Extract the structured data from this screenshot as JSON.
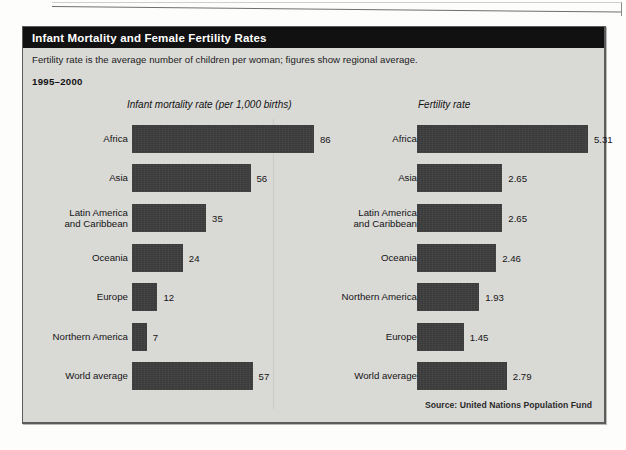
{
  "panel": {
    "title": "Infant Mortality and Female Fertility Rates",
    "subtitle": "Fertility rate is the average number of children per woman; figures show regional average.",
    "period": "1995–2000",
    "source": "Source: United Nations Population Fund"
  },
  "chart_data": [
    {
      "type": "bar",
      "orientation": "horizontal",
      "title": "Infant mortality rate (per 1,000 births)",
      "xlabel": "",
      "ylabel": "",
      "xlim": [
        0,
        86
      ],
      "grid": false,
      "legend": null,
      "categories": [
        "Africa",
        "Asia",
        "Latin America\nand Caribbean",
        "Oceania",
        "Europe",
        "Northern America",
        "World average"
      ],
      "values": [
        86,
        56,
        35,
        24,
        12,
        7,
        57
      ],
      "value_labels": [
        "86",
        "56",
        "35",
        "24",
        "12",
        "7",
        "57"
      ]
    },
    {
      "type": "bar",
      "orientation": "horizontal",
      "title": "Fertility rate",
      "xlabel": "",
      "ylabel": "",
      "xlim": [
        0,
        5.31
      ],
      "grid": false,
      "legend": null,
      "categories": [
        "Africa",
        "Asia",
        "Latin America\nand Caribbean",
        "Oceania",
        "Northern America",
        "Europe",
        "World average"
      ],
      "values": [
        5.31,
        2.65,
        2.65,
        2.46,
        1.93,
        1.45,
        2.79
      ],
      "value_labels": [
        "5.31",
        "2.65",
        "2.65",
        "2.46",
        "1.93",
        "1.45",
        "2.79"
      ]
    }
  ],
  "colors": {
    "bar": "#3a3a3a",
    "panel_background": "#d9d9d6",
    "title_bar": "#111111",
    "title_text": "#ffffff"
  }
}
